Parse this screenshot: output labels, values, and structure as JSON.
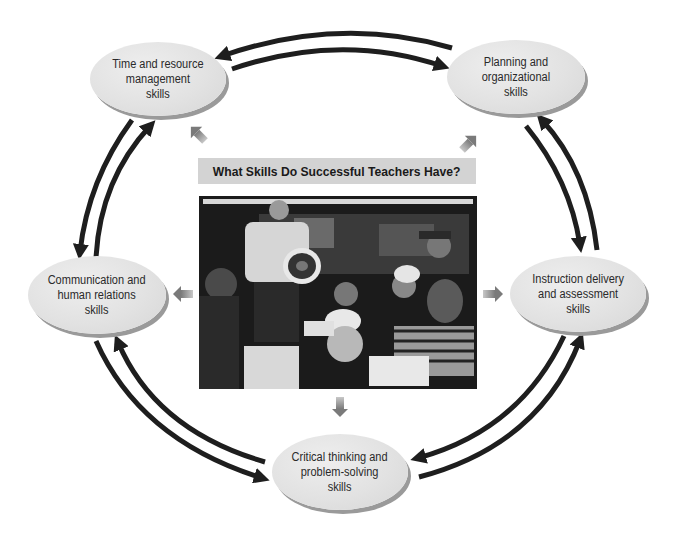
{
  "diagram": {
    "title": "What Skills Do Successful Teachers Have?",
    "center_image": {
      "description": "Black-and-white photograph of a teacher standing and holding a model of the earth's cross-section while students gathered around a table with a globe look on"
    },
    "nodes": [
      {
        "id": "time",
        "label": "Time and resource\nmanagement\nskills"
      },
      {
        "id": "planning",
        "label": "Planning and\norganizational\nskills"
      },
      {
        "id": "communication",
        "label": "Communication and\nhuman relations\nskills"
      },
      {
        "id": "instruction",
        "label": "Instruction delivery\nand assessment\nskills"
      },
      {
        "id": "critical",
        "label": "Critical thinking and\nproblem-solving\nskills"
      }
    ],
    "cycle_connections": [
      {
        "from": "time",
        "to": "planning",
        "bidirectional": true
      },
      {
        "from": "planning",
        "to": "instruction",
        "bidirectional": true
      },
      {
        "from": "instruction",
        "to": "critical",
        "bidirectional": true
      },
      {
        "from": "critical",
        "to": "communication",
        "bidirectional": true
      },
      {
        "from": "communication",
        "to": "time",
        "bidirectional": true
      }
    ],
    "center_to_node_arrows": [
      "time",
      "planning",
      "communication",
      "instruction",
      "critical"
    ],
    "colors": {
      "node_fill": "#e3e3e3",
      "node_shadow": "#9a9a9a",
      "cycle_arrow": "#1e1e1e",
      "center_arrow": "#8c8c8c",
      "title_bar": "#d3d3d3"
    }
  }
}
